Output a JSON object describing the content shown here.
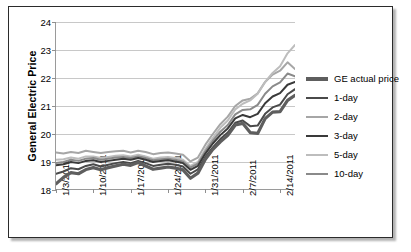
{
  "chart_data": {
    "type": "line",
    "title": "",
    "xlabel": "",
    "ylabel": "General Electric Price",
    "ylim": [
      18,
      24
    ],
    "yticks": [
      18,
      19,
      20,
      21,
      22,
      23,
      24
    ],
    "grid": true,
    "legend_position": "right",
    "xtick_labels": [
      "1/3/2011",
      "1/10/2011",
      "1/17/2011",
      "1/24/2011",
      "1/31/2011",
      "2/7/2011",
      "2/14/2011"
    ],
    "xtick_positions": [
      0,
      5,
      10,
      15,
      20,
      25,
      30
    ],
    "x": [
      0,
      1,
      2,
      3,
      4,
      5,
      6,
      7,
      8,
      9,
      10,
      11,
      12,
      13,
      14,
      15,
      16,
      17,
      18,
      19,
      20,
      21,
      22,
      23,
      24,
      25,
      26,
      27,
      28,
      29,
      30,
      31,
      32
    ],
    "series": [
      {
        "name": "GE actual price",
        "color": "#5e5e5e",
        "width": 3.2,
        "values": [
          18.22,
          18.45,
          18.62,
          18.58,
          18.73,
          18.8,
          18.72,
          18.8,
          18.86,
          18.92,
          18.88,
          18.98,
          18.86,
          18.74,
          18.78,
          18.82,
          18.78,
          18.72,
          18.42,
          18.6,
          19.1,
          19.45,
          19.72,
          19.95,
          20.32,
          20.38,
          20.05,
          20.02,
          20.55,
          20.78,
          20.8,
          21.2,
          21.38
        ]
      },
      {
        "name": "1-day",
        "color": "#4a4a4a",
        "width": 2.0,
        "values": [
          18.58,
          18.66,
          18.78,
          18.74,
          18.86,
          18.92,
          18.84,
          18.9,
          18.96,
          19.0,
          18.96,
          19.04,
          18.96,
          18.86,
          18.9,
          18.94,
          18.9,
          18.84,
          18.58,
          18.74,
          19.18,
          19.52,
          19.82,
          20.05,
          20.4,
          20.48,
          20.28,
          20.3,
          20.72,
          20.95,
          21.05,
          21.42,
          21.6
        ]
      },
      {
        "name": "2-day",
        "color": "#a6a6a6",
        "width": 2.0,
        "values": [
          19.34,
          19.3,
          19.36,
          19.32,
          19.4,
          19.36,
          19.32,
          19.36,
          19.38,
          19.4,
          19.34,
          19.4,
          19.36,
          19.28,
          19.32,
          19.34,
          19.3,
          19.26,
          19.02,
          19.16,
          19.62,
          20.0,
          20.35,
          20.62,
          21.0,
          21.2,
          21.26,
          21.45,
          21.86,
          22.12,
          22.26,
          22.56,
          22.32
        ]
      },
      {
        "name": "3-day",
        "color": "#3a3a3a",
        "width": 2.0,
        "values": [
          18.88,
          18.92,
          19.0,
          18.96,
          19.04,
          19.06,
          19.0,
          19.04,
          19.08,
          19.12,
          19.08,
          19.14,
          19.08,
          19.0,
          19.04,
          19.06,
          19.02,
          18.96,
          18.72,
          18.86,
          19.3,
          19.66,
          19.96,
          20.2,
          20.56,
          20.68,
          20.6,
          20.72,
          21.1,
          21.34,
          21.46,
          21.76,
          21.86
        ]
      },
      {
        "name": "5-day",
        "color": "#bdbdbd",
        "width": 2.0,
        "values": [
          19.08,
          19.1,
          19.16,
          19.12,
          19.2,
          19.2,
          19.14,
          19.18,
          19.22,
          19.24,
          19.2,
          19.26,
          19.2,
          19.12,
          19.16,
          19.18,
          19.14,
          19.08,
          18.86,
          19.0,
          19.46,
          19.86,
          20.22,
          20.48,
          20.88,
          21.08,
          21.2,
          21.44,
          21.86,
          22.18,
          22.42,
          22.88,
          23.18
        ]
      },
      {
        "name": "10-day",
        "color": "#8a8a8a",
        "width": 2.0,
        "values": [
          18.96,
          19.0,
          19.08,
          19.04,
          19.12,
          19.14,
          19.08,
          19.12,
          19.16,
          19.18,
          19.14,
          19.2,
          19.14,
          19.06,
          19.1,
          19.12,
          19.08,
          19.02,
          18.8,
          18.94,
          19.38,
          19.76,
          20.08,
          20.32,
          20.7,
          20.86,
          20.88,
          21.04,
          21.44,
          21.7,
          21.84,
          22.16,
          22.06
        ]
      }
    ]
  },
  "legend": {
    "items": [
      {
        "label": "GE actual price"
      },
      {
        "label": "1-day"
      },
      {
        "label": "2-day"
      },
      {
        "label": "3-day"
      },
      {
        "label": "5-day"
      },
      {
        "label": "10-day"
      }
    ]
  }
}
